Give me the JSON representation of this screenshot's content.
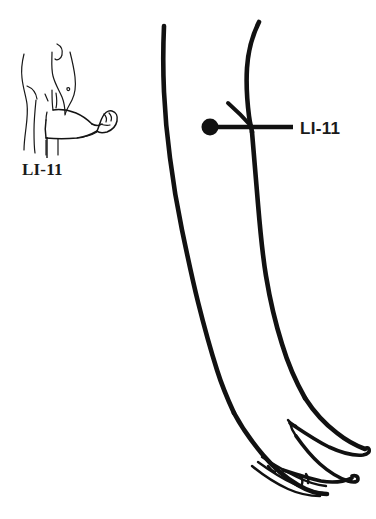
{
  "document": {
    "kind": "acupuncture-point-illustration",
    "background_color": "#ffffff",
    "ink_color": "#111111"
  },
  "inset_figure": {
    "name": "standing body with flexed arm",
    "description": "side view of torso with elbow bent and fist closed",
    "label": "LI-11",
    "label_x": 22,
    "label_y": 175,
    "leader": {
      "from_x": 47,
      "from_y": 137,
      "to_x": 47,
      "to_y": 158
    }
  },
  "main_figure": {
    "name": "extended arm with hand",
    "description": "large detail view of arm from upper arm to fingers",
    "point": {
      "name": "LI-11",
      "center_x": 210,
      "center_y": 127,
      "radius": 8.5
    },
    "leader": {
      "from_x": 215,
      "from_y": 127,
      "to_x": 293,
      "to_y": 127
    },
    "label": "LI-11",
    "label_x": 300,
    "label_y": 134
  }
}
